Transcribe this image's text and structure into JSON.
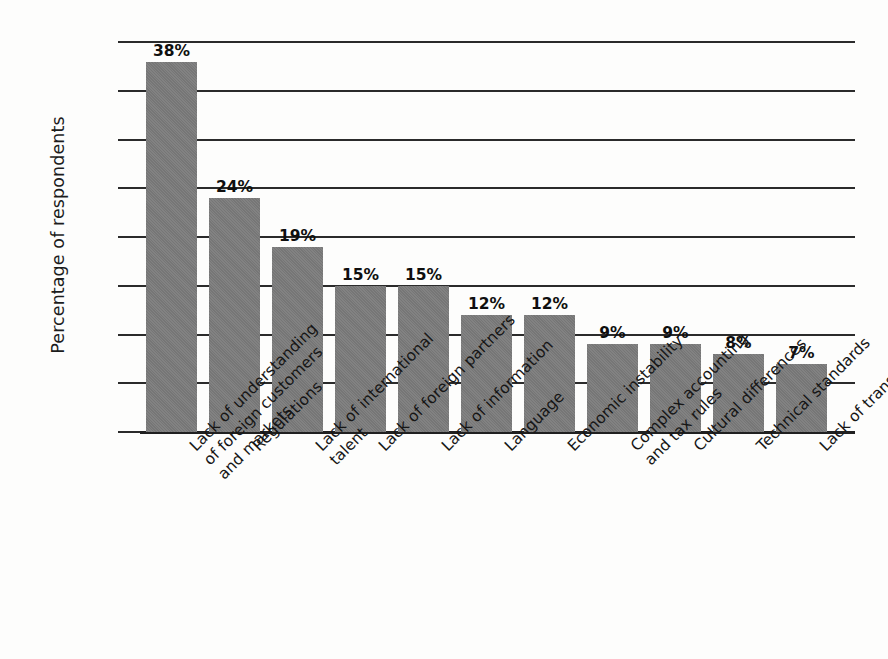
{
  "chart_data": {
    "type": "bar",
    "title": "",
    "subtitle": "",
    "xlabel": "",
    "ylabel": "Percentage of respondents",
    "ylim": [
      0,
      40
    ],
    "ytick_interval": 5,
    "yticks": [
      40,
      35,
      30,
      25,
      20,
      15,
      10,
      5,
      0
    ],
    "ytick_labels": [
      "40",
      "35",
      "30",
      "25",
      "20",
      "15",
      "10",
      "5",
      "0"
    ],
    "grid": "horizontal",
    "legend": "none",
    "value_label_suffix": "%",
    "categories": [
      "Lack of understanding of foreign customers and markets",
      "Regulations",
      "Lack of international talent",
      "Lack of foreign partners",
      "Lack of information",
      "Language",
      "Economic instability",
      "Complex accounting and tax rules",
      "Cultural differences",
      "Technical standards",
      "Lack of transportation"
    ],
    "category_label_lines": [
      [
        "Lack of understanding",
        "of foreign customers",
        "and markets"
      ],
      [
        "Regulations"
      ],
      [
        "Lack of international",
        "talent"
      ],
      [
        "Lack of foreign partners"
      ],
      [
        "Lack of information"
      ],
      [
        "Language"
      ],
      [
        "Economic instability"
      ],
      [
        "Complex accounting",
        "and tax rules"
      ],
      [
        "Cultural differences"
      ],
      [
        "Technical standards"
      ],
      [
        "Lack of transportation"
      ]
    ],
    "values": [
      38,
      24,
      19,
      15,
      15,
      12,
      12,
      9,
      9,
      8,
      7
    ],
    "value_labels": [
      "38%",
      "24%",
      "19%",
      "15%",
      "15%",
      "12%",
      "12%",
      "9%",
      "9%",
      "8%",
      "7%"
    ],
    "colors": {
      "bar_fill": "#7b7b7b",
      "gridline": "#2b2b2b",
      "axis": "#202020",
      "text": "#141414",
      "background": "#fdfdfc"
    }
  }
}
